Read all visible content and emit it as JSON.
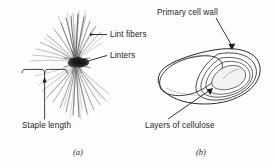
{
  "figure": {
    "background_color": "#fdfdfd",
    "ink_color": "#1d1d1d",
    "panels": [
      {
        "caption": "(a)",
        "name": "cotton-seed-with-fibers",
        "description": "Cotton seed with radiating tuft of lint fibers",
        "labels": [
          "Lint fibers",
          "Linters",
          "Staple length"
        ]
      },
      {
        "caption": "(b)",
        "name": "cotton-fiber-cross-section",
        "description": "Twisted ribbon-like cotton fiber showing wall layers and lumen",
        "labels": [
          "Primary cell wall",
          "Layers of cellulose"
        ]
      }
    ]
  },
  "labels": {
    "lint_fibers": "Lint fibers",
    "linters": "Linters",
    "staple_length": "Staple length",
    "primary_cell_wall": "Primary cell wall",
    "layers_of_cellulose": "Layers of cellulose"
  },
  "captions": {
    "panel_a": "(a)",
    "panel_b": "(b)"
  }
}
